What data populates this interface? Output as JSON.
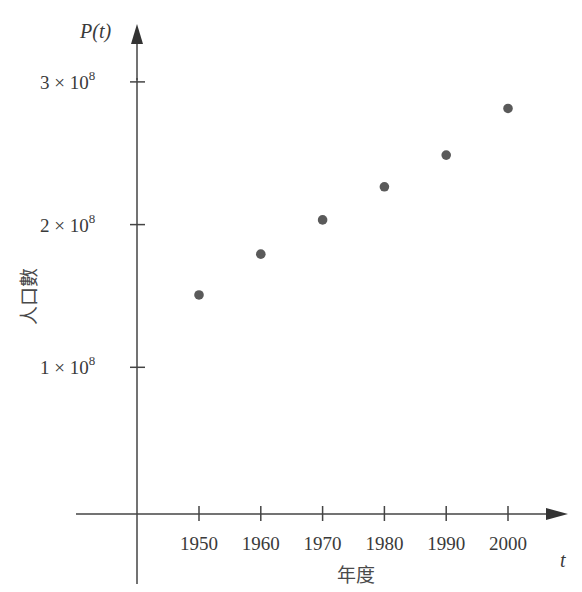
{
  "chart_data": {
    "type": "scatter",
    "title": "",
    "xlabel": "年度",
    "ylabel": "人口數",
    "x_axis_var": "t",
    "y_axis_var": "P(t)",
    "x": [
      1950,
      1960,
      1970,
      1980,
      1990,
      2000
    ],
    "y": [
      150700000,
      179300000,
      203300000,
      226500000,
      248700000,
      281400000
    ],
    "series": [
      {
        "name": "P(t)",
        "x": [
          1950,
          1960,
          1970,
          1980,
          1990,
          2000
        ],
        "values": [
          150700000,
          179300000,
          203300000,
          226500000,
          248700000,
          281400000
        ]
      }
    ],
    "x_ticks": [
      "1950",
      "1960",
      "1970",
      "1980",
      "1990",
      "2000"
    ],
    "y_ticks": [
      {
        "value": 100000000,
        "label_base": "1 × 10",
        "label_exp": "8"
      },
      {
        "value": 200000000,
        "label_base": "2 × 10",
        "label_exp": "8"
      },
      {
        "value": 300000000,
        "label_base": "3 × 10",
        "label_exp": "8"
      }
    ],
    "xlim": [
      1940,
      2010
    ],
    "ylim": [
      0,
      320000000
    ],
    "grid": false,
    "legend": "none",
    "colors": {
      "axis": "#444444",
      "point": "#5a5a5a",
      "text": "#3a3a3a"
    }
  }
}
